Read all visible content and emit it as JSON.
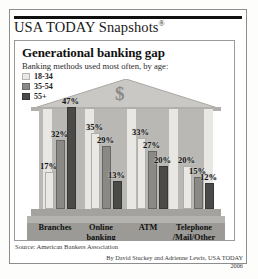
{
  "masthead": {
    "brand": "USA TODAY Snapshots",
    "registered": "®"
  },
  "card": {
    "title": "Generational banking gap",
    "subtitle": "Banking methods used most often, by age:"
  },
  "graphic": {
    "dollar_sign": "$"
  },
  "footer": {
    "source": "Source: American Bankers Association",
    "credit": "By David Stuckey and Adrienne Lewis, USA TODAY",
    "year": "2006"
  },
  "colors": {
    "series_18_34": "#e9e8e4",
    "series_35_54": "#8a8985",
    "series_55_plus": "#4a4a48",
    "building_body": "#b9b8b4",
    "roof": "#c9c8c4",
    "category_band": "#9b9a96"
  },
  "chart_data": {
    "type": "bar",
    "title": "Generational banking gap",
    "subtitle": "Banking methods used most often, by age:",
    "xlabel": "",
    "ylabel": "",
    "ylim": [
      0,
      50
    ],
    "grid": false,
    "legend_position": "top-left",
    "categories": [
      "Branches",
      "Online banking",
      "ATM",
      "Telephone /Mail/Other"
    ],
    "category_lines": [
      [
        "Branches"
      ],
      [
        "Online",
        "banking"
      ],
      [
        "ATM"
      ],
      [
        "Telephone",
        "/Mail/Other"
      ]
    ],
    "series": [
      {
        "name": "18-34",
        "values": [
          17,
          35,
          33,
          20
        ],
        "labels": [
          "17%",
          "35%",
          "33%",
          "20%"
        ]
      },
      {
        "name": "35-54",
        "values": [
          32,
          29,
          27,
          15
        ],
        "labels": [
          "32%",
          "29%",
          "27%",
          "15%"
        ]
      },
      {
        "name": "55+",
        "values": [
          47,
          13,
          20,
          12
        ],
        "labels": [
          "47%",
          "13%",
          "20%",
          "12%"
        ]
      }
    ]
  }
}
